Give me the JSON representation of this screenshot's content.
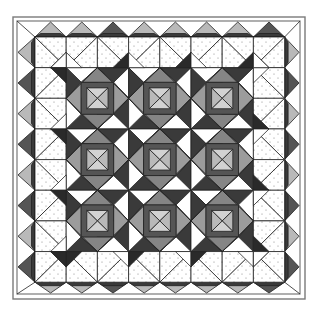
{
  "figure": {
    "title": ""
  },
  "canvas": {
    "width": 320,
    "height": 316
  },
  "palette": {
    "white": "#ffffff",
    "outline": "#222222",
    "dark": "#3a3a3a",
    "darker": "#2a2a2a",
    "mid_dark": "#555555",
    "medium": "#858585",
    "medium_light": "#9c9c9c",
    "light": "#b9b9b9",
    "lighter": "#d2d2d2",
    "dot_bg": "#ffffff",
    "dot": "#9a9a9a",
    "frame": "#7a7a7a"
  },
  "frame": {
    "outer": {
      "x": 13,
      "y": 17,
      "w": 292,
      "h": 282
    },
    "inner": {
      "x": 17,
      "y": 21,
      "w": 283,
      "h": 273
    }
  },
  "grid": {
    "x0": 35,
    "y0": 37,
    "step_x": 62.4,
    "step_y": 61.3,
    "units": 4
  },
  "blocks": {
    "centers": [
      [
        1,
        1
      ],
      [
        2,
        1
      ],
      [
        3,
        1
      ],
      [
        1,
        2
      ],
      [
        2,
        2
      ],
      [
        3,
        2
      ],
      [
        1,
        3
      ],
      [
        2,
        3
      ],
      [
        3,
        3
      ]
    ],
    "diamond_r": 0.5,
    "frame_half": 0.26,
    "core_half": 0.17
  },
  "border": {
    "teeth_per_side": 8,
    "top_fills": [
      "light",
      "light",
      "mid_dark",
      "light",
      "light",
      "light",
      "light",
      "mid_dark"
    ],
    "side_fills": [
      "light",
      "mid_dark",
      "light",
      "mid_dark",
      "light",
      "mid_dark",
      "light",
      "mid_dark"
    ]
  }
}
